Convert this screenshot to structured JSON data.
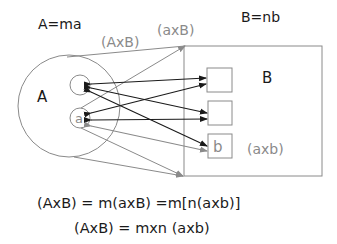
{
  "labels": {
    "set_a_def": "A=ma",
    "set_b_def": "B=nb",
    "product_upper": "(AxB)",
    "product_small_upper": "(axB)",
    "set_a": "A",
    "set_b": "B",
    "element_a": "a",
    "element_b": "b",
    "product_small": "(axb)"
  },
  "equations": [
    "(AxB) = m(axB) =m[n(axb)]",
    "(AxB) = mxn (axb)"
  ],
  "colors": {
    "dark": "#1a1a1a",
    "gray": "#8a8a8a",
    "line": "#7a7a7a"
  }
}
